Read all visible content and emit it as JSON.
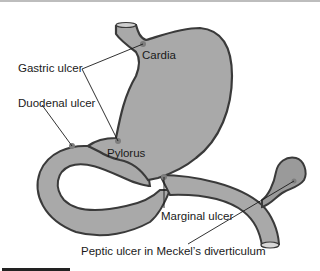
{
  "figure": {
    "colors": {
      "organ_fill": "#a9a9a9",
      "organ_outline": "#3a3a3a",
      "ulcer_dot": "#808080",
      "leader_line": "#1a1a1a",
      "text": "#1a1a1a"
    }
  },
  "labels": {
    "cardia": "Cardia",
    "gastric_ulcer": "Gastric ulcer",
    "duodenal_ulcer": "Duodenal ulcer",
    "pylorus": "Pylorus",
    "marginal_ulcer": "Marginal ulcer",
    "meckel": "Peptic ulcer in Meckel’s diverticulum"
  }
}
